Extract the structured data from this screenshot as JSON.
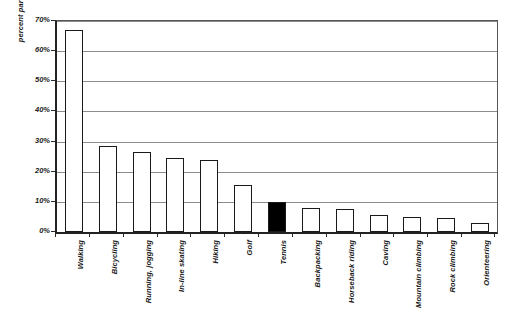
{
  "chart_data": {
    "type": "bar",
    "title": "",
    "subtitle": "",
    "xlabel": "",
    "ylabel": "percent participating",
    "ylim": [
      0,
      70
    ],
    "grid": true,
    "legend": "none",
    "y_ticks": [
      "0%",
      "10%",
      "20%",
      "30%",
      "40%",
      "50%",
      "60%",
      "70%"
    ],
    "y_tick_values": [
      0,
      10,
      20,
      30,
      40,
      50,
      60,
      70
    ],
    "categories": [
      "Walking",
      "Bicycling",
      "Running, jogging",
      "In-line skating",
      "Hiking",
      "Golf",
      "Tennis",
      "Backpacking",
      "Horseback riding",
      "Caving",
      "Mountain climbing",
      "Rock climbing",
      "Orienteering"
    ],
    "values": [
      67,
      28.5,
      26.5,
      24.5,
      24,
      15.5,
      10,
      8,
      7.5,
      5.5,
      5,
      4.5,
      3
    ],
    "highlighted_category": "Tennis",
    "bar_fill_default": "#ffffff",
    "bar_fill_highlight": "#000000",
    "bar_stroke": "#1a1a1a",
    "gridline_color": "#8c8c8c",
    "axis_color": "#222222"
  }
}
